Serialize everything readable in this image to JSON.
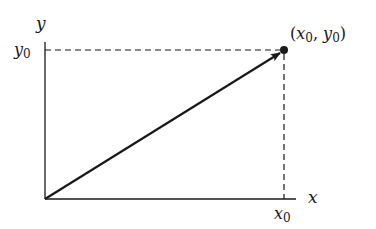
{
  "diagram": {
    "type": "vector-in-plane",
    "axes": {
      "x_label": "x",
      "y_label": "y"
    },
    "ticks": {
      "x_tick": {
        "base": "x",
        "sub": "0"
      },
      "y_tick": {
        "base": "y",
        "sub": "0"
      }
    },
    "point": {
      "label_open": "(",
      "x_base": "x",
      "x_sub": "0",
      "comma": ", ",
      "y_base": "y",
      "y_sub": "0",
      "label_close": ")"
    },
    "colors": {
      "line": "#1a1a1a",
      "background": "#ffffff"
    }
  }
}
